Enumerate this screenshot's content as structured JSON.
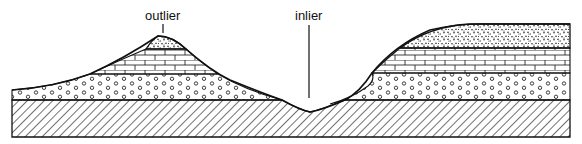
{
  "diagram": {
    "type": "geological-cross-section",
    "labels": {
      "outlier": "outlier",
      "inlier": "inlier"
    },
    "layers": [
      {
        "name": "basement",
        "pattern": "diagonal-hatch"
      },
      {
        "name": "lower-bed",
        "pattern": "circles"
      },
      {
        "name": "middle-bed",
        "pattern": "brick"
      },
      {
        "name": "upper-bed",
        "pattern": "speckled"
      }
    ],
    "colors": {
      "ink": "#111111",
      "paper": "#ffffff"
    }
  }
}
